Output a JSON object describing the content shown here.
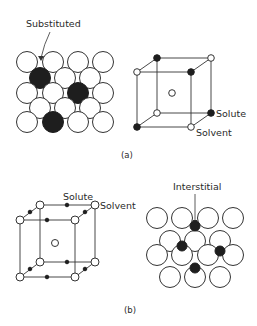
{
  "figure": {
    "panel_a": {
      "caption": "(a)",
      "lattice_label": "Substituted",
      "cube_labels": {
        "solute": "Solute",
        "solvent": "Solvent"
      },
      "description": "Substitutional solid solution: planar lattice with solute atoms replacing solvent atoms; BCC unit cell with solute at corners"
    },
    "panel_b": {
      "caption": "(b)",
      "lattice_label": "Interstitial",
      "cube_labels": {
        "solute": "Solute",
        "solvent": "Solvent"
      },
      "description": "Interstitial solid solution: BCC unit cell with small solute atoms at edge midpoints; planar lattice with small solute atoms in interstices"
    },
    "colors": {
      "line": "#333333",
      "solute": "#1e1e1e",
      "solvent": "#ffffff",
      "text": "#2a2a2a"
    }
  }
}
